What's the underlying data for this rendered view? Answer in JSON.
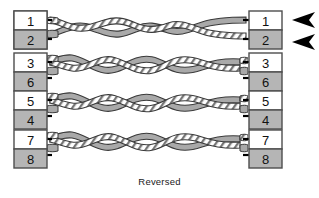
{
  "diagram": {
    "title_caption": "Reversed",
    "type": "ethernet-twisted-pair-wiring-diagram",
    "colors": {
      "pin_fill_odd": "#ffffff",
      "pin_fill_even": "#b5b5b5",
      "pin_border": "#4d4d4d",
      "wire_solid": "#a9a9a9",
      "wire_hatched_base": "#ffffff",
      "wire_outline": "#3a3a3a",
      "lead_line": "#000000",
      "arrow_fill": "#000000",
      "text": "#111111"
    },
    "left_connector": {
      "name": "left-connector",
      "pins": [
        {
          "label": "1",
          "shade": "white"
        },
        {
          "label": "2",
          "shade": "gray"
        },
        {
          "label": "3",
          "shade": "white"
        },
        {
          "label": "6",
          "shade": "gray"
        },
        {
          "label": "5",
          "shade": "white"
        },
        {
          "label": "4",
          "shade": "gray"
        },
        {
          "label": "7",
          "shade": "white"
        },
        {
          "label": "8",
          "shade": "gray"
        }
      ]
    },
    "right_connector": {
      "name": "right-connector",
      "pins": [
        {
          "label": "1",
          "shade": "white"
        },
        {
          "label": "2",
          "shade": "gray"
        },
        {
          "label": "3",
          "shade": "white"
        },
        {
          "label": "6",
          "shade": "gray"
        },
        {
          "label": "5",
          "shade": "white"
        },
        {
          "label": "4",
          "shade": "gray"
        },
        {
          "label": "7",
          "shade": "white"
        },
        {
          "label": "8",
          "shade": "gray"
        }
      ]
    },
    "pairs": [
      {
        "name": "pair-1-2",
        "left_pins": [
          "1",
          "2"
        ],
        "right_pins": [
          "1",
          "2"
        ],
        "crossed": true
      },
      {
        "name": "pair-3-6",
        "left_pins": [
          "3",
          "6"
        ],
        "right_pins": [
          "3",
          "6"
        ],
        "crossed": false
      },
      {
        "name": "pair-5-4",
        "left_pins": [
          "5",
          "4"
        ],
        "right_pins": [
          "5",
          "4"
        ],
        "crossed": false
      },
      {
        "name": "pair-7-8",
        "left_pins": [
          "7",
          "8"
        ],
        "right_pins": [
          "7",
          "8"
        ],
        "crossed": false
      }
    ],
    "annotations": {
      "arrow_markers": [
        {
          "name": "arrow-marker-pin-1",
          "points_to": "1",
          "direction": "left"
        },
        {
          "name": "arrow-marker-pin-2",
          "points_to": "2",
          "direction": "left"
        }
      ]
    }
  }
}
